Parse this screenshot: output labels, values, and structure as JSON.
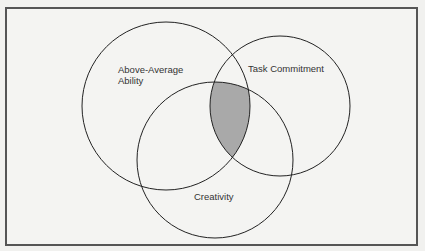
{
  "diagram": {
    "type": "venn",
    "sets": [
      {
        "label_line1": "Above-Average",
        "label_line2": "Ability"
      },
      {
        "label": "Task Commitment"
      },
      {
        "label": "Creativity"
      }
    ],
    "highlight": "intersection of all three",
    "colors": {
      "highlight": "#a9a9a9",
      "stroke": "#222222",
      "frame": "#555555"
    }
  }
}
